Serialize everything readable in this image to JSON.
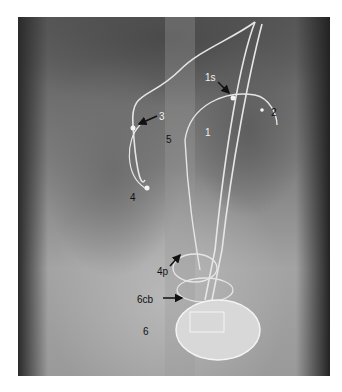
{
  "figure": {
    "labels": [
      {
        "text": "1s",
        "x": 205,
        "y": 73,
        "color": "white"
      },
      {
        "text": "2",
        "x": 271,
        "y": 108,
        "color": "black"
      },
      {
        "text": "3",
        "x": 159,
        "y": 112,
        "color": "white"
      },
      {
        "text": "1",
        "x": 205,
        "y": 128,
        "color": "white"
      },
      {
        "text": "5",
        "x": 166,
        "y": 135,
        "color": "black"
      },
      {
        "text": "4",
        "x": 130,
        "y": 193,
        "color": "black"
      },
      {
        "text": "4p",
        "x": 157,
        "y": 267,
        "color": "black"
      },
      {
        "text": "6cb",
        "x": 137,
        "y": 295,
        "color": "black"
      },
      {
        "text": "6",
        "x": 143,
        "y": 327,
        "color": "black"
      }
    ]
  }
}
